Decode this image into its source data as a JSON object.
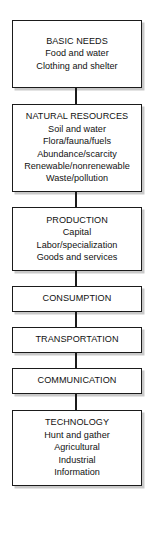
{
  "diagram": {
    "orientation": "vertical-top-to-bottom",
    "colors": {
      "background": "#ffffff",
      "border": "#1b1b1b",
      "text": "#111111",
      "shadow": "#c9c9c9"
    },
    "nodes": [
      {
        "id": "basic-needs",
        "title": "BASIC NEEDS",
        "lines": [
          "Food and water",
          "Clothing and shelter"
        ]
      },
      {
        "id": "natural-resources",
        "title": "NATURAL RESOURCES",
        "lines": [
          "Soil and water",
          "Flora/fauna/fuels",
          "Abundance/scarcity",
          "Renewable/nonrenewable",
          "Waste/pollution"
        ]
      },
      {
        "id": "production",
        "title": "PRODUCTION",
        "lines": [
          "Capital",
          "Labor/specialization",
          "Goods and services"
        ]
      },
      {
        "id": "consumption",
        "title": "CONSUMPTION",
        "lines": []
      },
      {
        "id": "transportation",
        "title": "TRANSPORTATION",
        "lines": []
      },
      {
        "id": "communication",
        "title": "COMMUNICATION",
        "lines": []
      },
      {
        "id": "technology",
        "title": "TECHNOLOGY",
        "lines": [
          "Hunt and gather",
          "Agricultural",
          "Industrial",
          "Information"
        ]
      }
    ]
  }
}
